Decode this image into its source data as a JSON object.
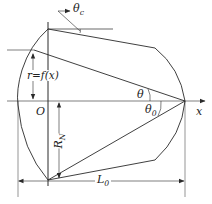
{
  "diagram": {
    "type": "ogive-nose-geometry",
    "colors": {
      "line": "#2a2a2a",
      "background": "#ffffff"
    },
    "labels": {
      "theta_c": "θ",
      "theta_c_sub": "c",
      "r_eq": "r=f(x)",
      "origin": "O",
      "theta": "θ",
      "theta0": "θ",
      "theta0_sub": "0",
      "x_axis": "x",
      "RN": "R",
      "RN_sub": "N",
      "L0": "L",
      "L0_sub": "0"
    }
  }
}
